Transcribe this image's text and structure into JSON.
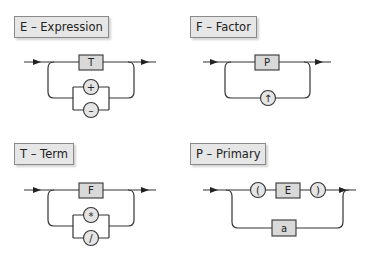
{
  "diagrams": [
    {
      "title": "E – Expression",
      "main": {
        "nonterminal": "T"
      },
      "loop_terminals": [
        "+",
        "–"
      ]
    },
    {
      "title": "F – Factor",
      "main": {
        "nonterminal": "P"
      },
      "loop_terminals": [
        "↑"
      ]
    },
    {
      "title": "T – Term",
      "main": {
        "nonterminal": "F"
      },
      "loop_terminals": [
        "*",
        "/"
      ]
    },
    {
      "title": "P – Primary",
      "main": {
        "sequence": [
          "(",
          "E",
          ")"
        ]
      },
      "alternative": {
        "nonterminal": "a"
      }
    }
  ],
  "colors": {
    "line": "#333333",
    "nonterminal_fill": "#d9d9d9",
    "terminal_fill": "#e4e4e4",
    "label_fill": "#e6e6e6",
    "background": "#ffffff"
  }
}
